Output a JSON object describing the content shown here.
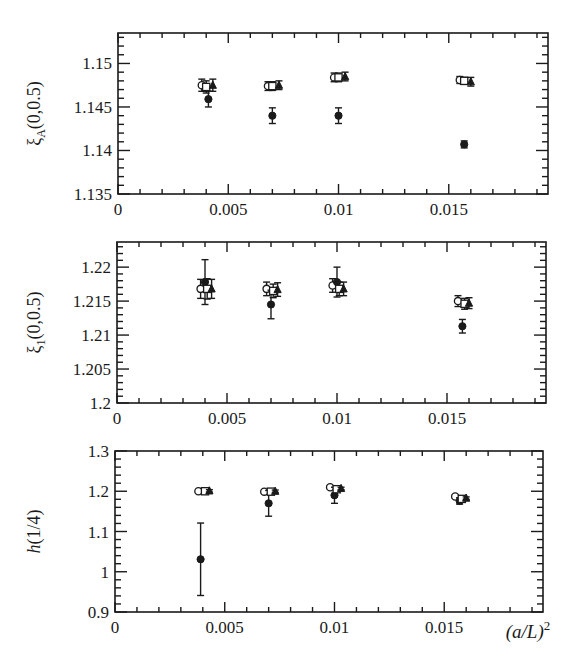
{
  "figure": {
    "xlabel": "(a/L)²",
    "xlabel_parts": {
      "base": "(a/L)",
      "sup": "2"
    },
    "colors": {
      "ink": "#1a1a1a",
      "background": "#ffffff"
    }
  },
  "chart_data": [
    {
      "type": "scatter",
      "panel": "top",
      "ylabel": "ξA(0,0.5)",
      "ylabel_parts": {
        "sym": "ξ",
        "sub": "A",
        "rest": "(0,0.5)"
      },
      "xlabel": "",
      "xlim": [
        0,
        0.0195
      ],
      "ylim": [
        1.135,
        1.1535
      ],
      "xticks": [
        0,
        0.005,
        0.01,
        0.015
      ],
      "xtick_labels": [
        "0",
        "0.005",
        "0.01",
        "0.015"
      ],
      "yticks": [
        1.135,
        1.14,
        1.145,
        1.15
      ],
      "ytick_labels": [
        "1.135",
        "1.14",
        "1.145",
        "1.15"
      ],
      "y_minor_step": 0.001,
      "x_minor_step": 0.001,
      "series": [
        {
          "name": "open circles",
          "marker": "open-circle",
          "points": [
            [
              0.0038,
              1.1475,
              0.0007
            ],
            [
              0.0068,
              1.1474,
              0.0005
            ],
            [
              0.0098,
              1.1484,
              0.0005
            ],
            [
              0.0155,
              1.1481,
              0.0004
            ]
          ]
        },
        {
          "name": "filled circles",
          "marker": "filled-circle",
          "points": [
            [
              0.0041,
              1.1459,
              0.0009
            ],
            [
              0.007,
              1.144,
              0.0009
            ],
            [
              0.01,
              1.144,
              0.0009
            ],
            [
              0.0157,
              1.1407,
              0.0004
            ]
          ]
        },
        {
          "name": "open squares",
          "marker": "open-square",
          "points": [
            [
              0.004,
              1.1473,
              0.0007
            ],
            [
              0.007,
              1.1474,
              0.0005
            ],
            [
              0.01,
              1.1484,
              0.0005
            ],
            [
              0.0157,
              1.148,
              0.0004
            ]
          ]
        },
        {
          "name": "filled triangles",
          "marker": "filled-triangle",
          "points": [
            [
              0.0043,
              1.1475,
              0.0007
            ],
            [
              0.0073,
              1.1475,
              0.0005
            ],
            [
              0.0103,
              1.1485,
              0.0005
            ],
            [
              0.016,
              1.1479,
              0.0005
            ]
          ]
        }
      ]
    },
    {
      "type": "scatter",
      "panel": "middle",
      "ylabel": "ξ1(0,0.5)",
      "ylabel_parts": {
        "sym": "ξ",
        "sub": "1",
        "rest": "(0,0.5)"
      },
      "xlabel": "",
      "xlim": [
        0,
        0.0195
      ],
      "ylim": [
        1.2,
        1.2237
      ],
      "xticks": [
        0,
        0.005,
        0.01,
        0.015
      ],
      "xtick_labels": [
        "0",
        "0.005",
        "0.01",
        "0.015"
      ],
      "yticks": [
        1.2,
        1.205,
        1.21,
        1.215,
        1.22
      ],
      "ytick_labels": [
        "1.2",
        "1.205",
        "1.21",
        "1.215",
        "1.22"
      ],
      "y_minor_step": 0.001,
      "x_minor_step": 0.001,
      "series": [
        {
          "name": "open circles",
          "marker": "open-circle",
          "points": [
            [
              0.0038,
              1.2168,
              0.0014
            ],
            [
              0.0068,
              1.2168,
              0.001
            ],
            [
              0.0098,
              1.2173,
              0.001
            ],
            [
              0.0155,
              1.215,
              0.0008
            ]
          ]
        },
        {
          "name": "filled circles",
          "marker": "filled-circle",
          "points": [
            [
              0.004,
              1.2178,
              0.0033
            ],
            [
              0.007,
              1.2145,
              0.0021
            ],
            [
              0.01,
              1.2178,
              0.0022
            ],
            [
              0.0157,
              1.2113,
              0.001
            ]
          ]
        },
        {
          "name": "open squares",
          "marker": "open-square",
          "points": [
            [
              0.0041,
              1.2168,
              0.0015
            ],
            [
              0.0071,
              1.2165,
              0.001
            ],
            [
              0.0101,
              1.2168,
              0.001
            ],
            [
              0.0158,
              1.2146,
              0.0008
            ]
          ]
        },
        {
          "name": "filled triangles",
          "marker": "filled-triangle",
          "points": [
            [
              0.0043,
              1.2168,
              0.0014
            ],
            [
              0.0073,
              1.2167,
              0.001
            ],
            [
              0.0103,
              1.2168,
              0.001
            ],
            [
              0.016,
              1.2147,
              0.0008
            ]
          ]
        }
      ]
    },
    {
      "type": "scatter",
      "panel": "bottom",
      "ylabel": "h(1/4)",
      "xlabel": "(a/L)²",
      "xlim": [
        0,
        0.0195
      ],
      "ylim": [
        0.9,
        1.3
      ],
      "xticks": [
        0,
        0.005,
        0.01,
        0.015
      ],
      "xtick_labels": [
        "0",
        "0.005",
        "0.01",
        "0.015"
      ],
      "yticks": [
        0.9,
        1.0,
        1.1,
        1.2,
        1.3
      ],
      "ytick_labels": [
        "0.9",
        "1",
        "1.1",
        "1.2",
        "1.3"
      ],
      "y_minor_step": 0.02,
      "x_minor_step": 0.001,
      "series": [
        {
          "name": "open circles",
          "marker": "open-circle",
          "points": [
            [
              0.0038,
              1.2,
              0.003
            ],
            [
              0.0068,
              1.199,
              0.003
            ],
            [
              0.0098,
              1.21,
              0.003
            ],
            [
              0.0155,
              1.187,
              0.003
            ]
          ]
        },
        {
          "name": "filled circles",
          "marker": "filled-circle",
          "points": [
            [
              0.0039,
              1.031,
              0.09
            ],
            [
              0.007,
              1.17,
              0.032
            ],
            [
              0.01,
              1.19,
              0.02
            ],
            [
              0.0157,
              1.176,
              0.008
            ]
          ]
        },
        {
          "name": "open squares",
          "marker": "open-square",
          "points": [
            [
              0.0041,
              1.2,
              0.003
            ],
            [
              0.0071,
              1.199,
              0.003
            ],
            [
              0.0101,
              1.205,
              0.003
            ],
            [
              0.0158,
              1.181,
              0.003
            ]
          ]
        },
        {
          "name": "filled triangles",
          "marker": "filled-triangle",
          "points": [
            [
              0.0043,
              1.201,
              0.003
            ],
            [
              0.0073,
              1.2,
              0.003
            ],
            [
              0.0103,
              1.207,
              0.003
            ],
            [
              0.016,
              1.183,
              0.003
            ]
          ]
        }
      ]
    }
  ]
}
